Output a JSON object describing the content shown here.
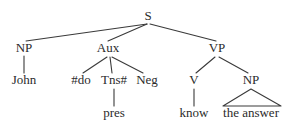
{
  "figure": {
    "type": "syntax-tree",
    "background_color": "#ffffff",
    "ink_color": "#2b2b2b",
    "line_color": "#3a3a3a"
  },
  "nodes": {
    "root": {
      "label": "S",
      "x": 148,
      "y": 20
    },
    "np_subject": {
      "label": "NP",
      "x": 24,
      "y": 52
    },
    "aux": {
      "label": "Aux",
      "x": 108,
      "y": 52
    },
    "vp": {
      "label": "VP",
      "x": 217,
      "y": 52
    },
    "do_support": {
      "label": "#do",
      "x": 81,
      "y": 84
    },
    "tense": {
      "label": "Tns#",
      "x": 114,
      "y": 84
    },
    "negation": {
      "label": "Neg",
      "x": 147,
      "y": 84
    },
    "verb": {
      "label": "V",
      "x": 194,
      "y": 84
    },
    "np_object": {
      "label": "NP",
      "x": 251,
      "y": 84
    }
  },
  "leaves": {
    "subject_word": {
      "label": "John",
      "x": 24,
      "y": 84
    },
    "tense_value": {
      "label": "pres",
      "x": 114,
      "y": 117
    },
    "verb_word": {
      "label": "know",
      "x": 194,
      "y": 117
    },
    "object_phrase": {
      "label": "the answer",
      "x": 251,
      "y": 117
    }
  },
  "edges": [
    {
      "from": "S",
      "to": "NP",
      "x1": 147,
      "y1": 24,
      "x2": 26,
      "y2": 41
    },
    {
      "from": "S",
      "to": "Aux",
      "x1": 147,
      "y1": 24,
      "x2": 108,
      "y2": 41
    },
    {
      "from": "S",
      "to": "VP",
      "x1": 150,
      "y1": 24,
      "x2": 216,
      "y2": 41
    },
    {
      "from": "NP",
      "to": "John",
      "x1": 24,
      "y1": 56,
      "x2": 24,
      "y2": 73
    },
    {
      "from": "Aux",
      "to": "#do",
      "x1": 107,
      "y1": 57,
      "x2": 83,
      "y2": 73
    },
    {
      "from": "Aux",
      "to": "Tns#",
      "x1": 110,
      "y1": 57,
      "x2": 112,
      "y2": 73
    },
    {
      "from": "Aux",
      "to": "Neg",
      "x1": 112,
      "y1": 57,
      "x2": 143,
      "y2": 73
    },
    {
      "from": "Tns#",
      "to": "pres",
      "x1": 114,
      "y1": 89,
      "x2": 114,
      "y2": 106
    },
    {
      "from": "VP",
      "to": "V",
      "x1": 215,
      "y1": 57,
      "x2": 196,
      "y2": 73
    },
    {
      "from": "VP",
      "to": "NP",
      "x1": 219,
      "y1": 57,
      "x2": 248,
      "y2": 73
    },
    {
      "from": "V",
      "to": "know",
      "x1": 194,
      "y1": 89,
      "x2": 194,
      "y2": 106
    }
  ],
  "triangle": {
    "covers": "the answer",
    "apex_x": 251,
    "apex_y": 89,
    "left_x": 223,
    "right_x": 281,
    "base_y": 106
  }
}
